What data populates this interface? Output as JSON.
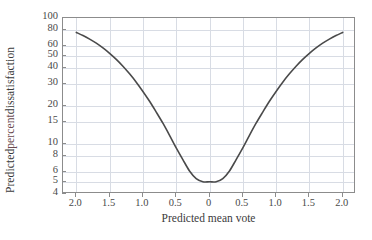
{
  "chart_data": {
    "type": "line",
    "title": "",
    "xlabel": "Predicted mean vote",
    "ylabel": "Predicted percent dissatisfaction",
    "yscale": "log",
    "ylim": [
      4,
      100
    ],
    "xlim": [
      -2.2,
      2.2
    ],
    "grid": true,
    "legend": "none",
    "y_ticks": [
      {
        "value": 100,
        "label": "100"
      },
      {
        "value": 80,
        "label": "80"
      },
      {
        "value": 60,
        "label": "60"
      },
      {
        "value": 50,
        "label": "50"
      },
      {
        "value": 40,
        "label": "40"
      },
      {
        "value": 30,
        "label": "30"
      },
      {
        "value": 20,
        "label": "20"
      },
      {
        "value": 15,
        "label": "15"
      },
      {
        "value": 10,
        "label": "10"
      },
      {
        "value": 8,
        "label": "8"
      },
      {
        "value": 6,
        "label": "6"
      },
      {
        "value": 5,
        "label": "5"
      },
      {
        "value": 4,
        "label": "4"
      }
    ],
    "x_ticks": [
      {
        "value": -2.0,
        "label": "2.0"
      },
      {
        "value": -1.5,
        "label": "1.5"
      },
      {
        "value": -1.0,
        "label": "1.0"
      },
      {
        "value": -0.5,
        "label": "0.5"
      },
      {
        "value": 0.0,
        "label": "0"
      },
      {
        "value": 0.5,
        "label": "0.5"
      },
      {
        "value": 1.0,
        "label": "1.0"
      },
      {
        "value": 1.5,
        "label": "1.5"
      },
      {
        "value": 2.0,
        "label": "2.0"
      }
    ],
    "series": [
      {
        "name": "Predicted percent dissatisfaction",
        "color": "#4a4a4a",
        "linewidth": 1.6,
        "x": [
          -2.0,
          -1.9,
          -1.8,
          -1.7,
          -1.6,
          -1.5,
          -1.4,
          -1.3,
          -1.2,
          -1.1,
          -1.0,
          -0.9,
          -0.8,
          -0.7,
          -0.6,
          -0.5,
          -0.4,
          -0.3,
          -0.2,
          -0.1,
          0.0,
          0.1,
          0.2,
          0.3,
          0.4,
          0.5,
          0.6,
          0.7,
          0.8,
          0.9,
          1.0,
          1.1,
          1.2,
          1.3,
          1.4,
          1.5,
          1.6,
          1.7,
          1.8,
          1.9,
          2.0
        ],
        "y": [
          76.8,
          72.6,
          68.0,
          63.1,
          57.8,
          52.4,
          46.9,
          41.4,
          36.0,
          30.9,
          26.1,
          21.8,
          17.9,
          14.6,
          11.7,
          9.3,
          7.5,
          6.1,
          5.3,
          5.0,
          5.0,
          5.0,
          5.3,
          6.1,
          7.5,
          9.3,
          11.7,
          14.6,
          17.9,
          21.8,
          26.1,
          30.9,
          36.0,
          41.4,
          46.9,
          52.4,
          57.8,
          63.1,
          68.0,
          72.6,
          76.8
        ]
      }
    ]
  },
  "axes": {
    "x_title": "Predicted mean vote",
    "y_title_prefix": "Predicted ",
    "y_title_tint": "percent",
    "y_title_suffix": " dissatisfaction"
  },
  "colors": {
    "curve": "#4a4a4a",
    "grid": "#d8dce4",
    "frame": "#8c8c8c",
    "text": "#3b3b3b",
    "background": "#ffffff"
  }
}
